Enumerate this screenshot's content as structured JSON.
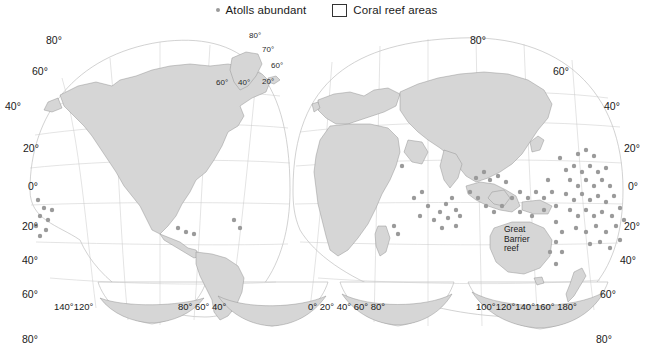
{
  "legend": {
    "atolls": {
      "label": "Atolls abundant",
      "marker": "dot-marker",
      "color": "#9a9a9a"
    },
    "reefs": {
      "label": "Coral reef areas",
      "marker": "box-marker",
      "color": "#ffffff"
    }
  },
  "map": {
    "projection": "interrupted-goode-homolosine",
    "land_color": "#d6d6d6",
    "ocean_color": "#ffffff",
    "graticule_color": "#c9c9c9",
    "annotation": {
      "great_barrier_reef": "Great\nBarrier\nreef"
    },
    "gbr_line1": "Great",
    "gbr_line2": "Barrier",
    "gbr_line3": "reef"
  },
  "axes": {
    "latitude_left": [
      "80°",
      "60°",
      "40°",
      "20°",
      "0°",
      "20°",
      "40°",
      "60°",
      "80°"
    ],
    "latitude_right": [
      "80°",
      "60°",
      "40°",
      "20°",
      "0°",
      "20°",
      "40°",
      "60°",
      "80°"
    ],
    "longitude_lobe1": [
      "140°",
      "120°"
    ],
    "longitude_lobe2": [
      "80°",
      "60°",
      "40°"
    ],
    "longitude_lobe3": [
      "0°",
      "20°",
      "40°",
      "60°",
      "80°"
    ],
    "longitude_lobe4": [
      "100°",
      "120°",
      "140°",
      "160°",
      "180°"
    ],
    "inset_greenland": [
      "80°",
      "70°",
      "60°",
      "20°",
      "60°",
      "40°"
    ]
  },
  "lat_l0": "80°",
  "lat_l1": "60°",
  "lat_l2": "40°",
  "lat_l3": "20°",
  "lat_l4": "0°",
  "lat_l5": "20°",
  "lat_l6": "40°",
  "lat_l7": "60°",
  "lat_l8": "80°",
  "lat_r0": "80°",
  "lat_r1": "60°",
  "lat_r2": "40°",
  "lat_r3": "20°",
  "lat_r4": "0°",
  "lat_r5": "20°",
  "lat_r6": "40°",
  "lat_r7": "60°",
  "lat_r8": "80°",
  "lon_a": "140°120°",
  "lon_b": "80°  60°  40°",
  "lon_c": "0°  20°  40°  60°  80°",
  "lon_d": "100°120°140°160°  180°",
  "ins_a": "80°",
  "ins_b": "70°",
  "ins_c": "60°",
  "ins_d": "20°",
  "ins_e": "60°",
  "ins_f": "40°"
}
